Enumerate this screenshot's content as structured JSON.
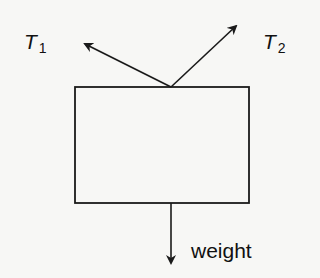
{
  "diagram": {
    "type": "free-body-diagram",
    "body": {
      "shape": "rectangle",
      "x": 75,
      "y": 87,
      "width": 174,
      "height": 116
    },
    "forces": [
      {
        "id": "T1",
        "symbol": "T",
        "subscript": "1",
        "direction": "up-left",
        "from": [
          171,
          87
        ],
        "to": [
          83,
          43
        ]
      },
      {
        "id": "T2",
        "symbol": "T",
        "subscript": "2",
        "direction": "up-right",
        "from": [
          171,
          87
        ],
        "to": [
          238,
          24
        ]
      },
      {
        "id": "weight",
        "label": "weight",
        "direction": "down",
        "from": [
          171,
          203
        ],
        "to": [
          171,
          265
        ]
      }
    ],
    "colors": {
      "line": "#1a1a1a",
      "background": "#f7f7f5"
    }
  }
}
